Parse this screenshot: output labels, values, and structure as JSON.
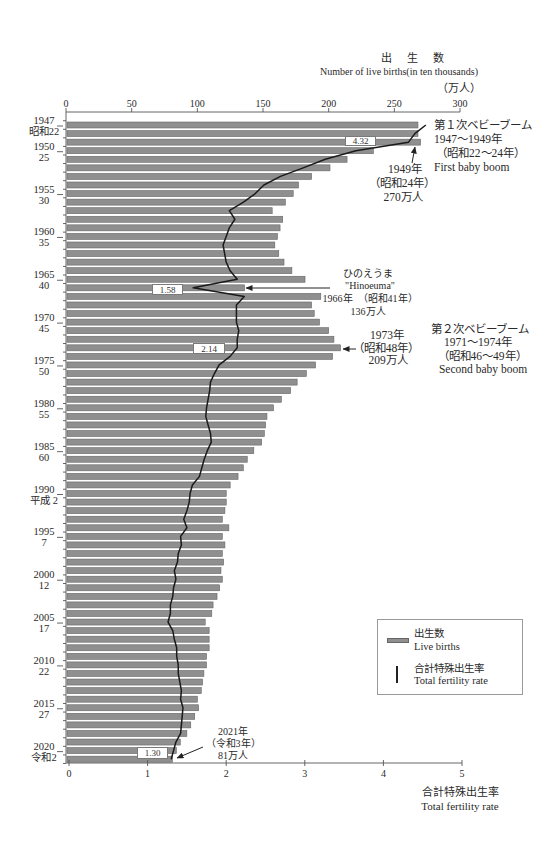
{
  "chart_data": {
    "type": "bar",
    "title": "出　生　数",
    "subtitle": "Number of live births(in ten thousands)",
    "top_axis": {
      "label_jp": "出　生　数",
      "label_en": "Number of live births(in ten thousands)",
      "unit": "（万人）",
      "ticks": [
        0,
        50,
        100,
        150,
        200,
        250,
        300
      ],
      "range": [
        0,
        300
      ]
    },
    "bottom_axis": {
      "label_jp": "合計特殊出生率",
      "label_en": "Total fertility rate",
      "ticks": [
        0,
        1,
        2,
        3,
        4,
        5
      ],
      "range": [
        0,
        5
      ]
    },
    "orientation": "horizontal",
    "grid": false,
    "legend_position": "lower right",
    "categories": [
      1947,
      1948,
      1949,
      1950,
      1951,
      1952,
      1953,
      1954,
      1955,
      1956,
      1957,
      1958,
      1959,
      1960,
      1961,
      1962,
      1963,
      1964,
      1965,
      1966,
      1967,
      1968,
      1969,
      1970,
      1971,
      1972,
      1973,
      1974,
      1975,
      1976,
      1977,
      1978,
      1979,
      1980,
      1981,
      1982,
      1983,
      1984,
      1985,
      1986,
      1987,
      1988,
      1989,
      1990,
      1991,
      1992,
      1993,
      1994,
      1995,
      1996,
      1997,
      1998,
      1999,
      2000,
      2001,
      2002,
      2003,
      2004,
      2005,
      2006,
      2007,
      2008,
      2009,
      2010,
      2011,
      2012,
      2013,
      2014,
      2015,
      2016,
      2017,
      2018,
      2019,
      2020,
      2021
    ],
    "category_labels": [
      {
        "year": 1947,
        "era": "昭和22"
      },
      {
        "year": 1950,
        "era": "25"
      },
      {
        "year": 1955,
        "era": "30"
      },
      {
        "year": 1960,
        "era": "35"
      },
      {
        "year": 1965,
        "era": "40"
      },
      {
        "year": 1970,
        "era": "45"
      },
      {
        "year": 1975,
        "era": "50"
      },
      {
        "year": 1980,
        "era": "55"
      },
      {
        "year": 1985,
        "era": "60"
      },
      {
        "year": 1990,
        "era": "平成 2"
      },
      {
        "year": 1995,
        "era": "7"
      },
      {
        "year": 2000,
        "era": "12"
      },
      {
        "year": 2005,
        "era": "17"
      },
      {
        "year": 2010,
        "era": "22"
      },
      {
        "year": 2015,
        "era": "27"
      },
      {
        "year": 2020,
        "era": "令和2"
      }
    ],
    "series": [
      {
        "name": "出生数 Live births",
        "type": "bar",
        "axis": "top",
        "unit": "万人",
        "values": [
          268,
          268,
          270,
          234,
          214,
          201,
          187,
          177,
          173,
          167,
          157,
          165,
          163,
          161,
          159,
          162,
          166,
          172,
          182,
          136,
          194,
          187,
          189,
          193,
          200,
          204,
          209,
          203,
          190,
          183,
          176,
          171,
          164,
          158,
          153,
          152,
          151,
          149,
          143,
          138,
          135,
          131,
          125,
          122,
          122,
          121,
          119,
          124,
          119,
          121,
          119,
          120,
          118,
          119,
          117,
          115,
          112,
          111,
          106,
          109,
          109,
          109,
          107,
          107,
          105,
          104,
          103,
          100,
          101,
          98,
          95,
          92,
          87,
          84,
          81
        ]
      },
      {
        "name": "合計特殊出生率 Total fertility rate",
        "type": "line",
        "axis": "bottom",
        "values": [
          4.54,
          4.4,
          4.32,
          3.65,
          3.26,
          2.98,
          2.69,
          2.48,
          2.37,
          2.22,
          2.04,
          2.11,
          2.04,
          2.0,
          1.96,
          1.98,
          2.0,
          2.05,
          2.14,
          1.58,
          2.23,
          2.13,
          2.13,
          2.13,
          2.16,
          2.14,
          2.14,
          2.05,
          1.91,
          1.85,
          1.8,
          1.79,
          1.77,
          1.75,
          1.74,
          1.77,
          1.8,
          1.81,
          1.76,
          1.72,
          1.69,
          1.66,
          1.57,
          1.54,
          1.53,
          1.5,
          1.46,
          1.5,
          1.42,
          1.43,
          1.39,
          1.38,
          1.34,
          1.36,
          1.33,
          1.32,
          1.29,
          1.29,
          1.26,
          1.32,
          1.34,
          1.37,
          1.37,
          1.39,
          1.39,
          1.41,
          1.43,
          1.42,
          1.45,
          1.44,
          1.43,
          1.42,
          1.36,
          1.33,
          1.3
        ]
      }
    ],
    "value_labels": [
      {
        "year": 1949,
        "text": "4.32"
      },
      {
        "year": 1966,
        "text": "1.58"
      },
      {
        "year": 1973,
        "text": "2.14"
      },
      {
        "year": 2021,
        "text": "1.30"
      }
    ],
    "annotations": [
      {
        "id": "first-baby-boom",
        "lines": [
          "第１次ベビーブーム",
          "1947～1949年",
          "（昭和22～24年）",
          "First baby boom"
        ]
      },
      {
        "id": "peak-1949",
        "lines": [
          "1949年",
          "（昭和24年）",
          "270万人"
        ]
      },
      {
        "id": "hinoeuma-1966",
        "lines": [
          "ひのえうま",
          "\"Hinoeuma\"",
          "1966年　（昭和41年）",
          "136万人"
        ]
      },
      {
        "id": "peak-1973",
        "lines": [
          "1973年",
          "（昭和48年）",
          "209万人"
        ]
      },
      {
        "id": "second-baby-boom",
        "lines": [
          "第２次ベビーブーム",
          "1971～1974年",
          "（昭和46～49年）",
          "Second baby boom"
        ]
      },
      {
        "id": "latest-2021",
        "lines": [
          "2021年",
          "（令和3年）",
          "81万人"
        ]
      }
    ],
    "legend": [
      {
        "label_jp": "出生数",
        "label_en": "Live births",
        "symbol": "bar"
      },
      {
        "label_jp": "合計特殊出生率",
        "label_en": "Total fertility rate",
        "symbol": "line"
      }
    ],
    "colors": {
      "bar": "#8f8f8f",
      "bar_edge": "#666666",
      "line": "#1a1a1a",
      "axis": "#555555"
    }
  }
}
